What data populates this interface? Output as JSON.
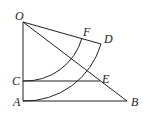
{
  "diagram": {
    "labels": {
      "O": "O",
      "F": "F",
      "D": "D",
      "C": "C",
      "E": "E",
      "A": "A",
      "B": "B"
    },
    "points": {
      "O": [
        23,
        22
      ],
      "F": [
        82,
        38
      ],
      "D": [
        101,
        44
      ],
      "C": [
        23,
        81
      ],
      "E": [
        100,
        81
      ],
      "A": [
        23,
        101
      ],
      "B": [
        127,
        101
      ]
    },
    "segments": [
      "OA",
      "OD",
      "OB",
      "CE",
      "AB"
    ],
    "arcs": [
      "C to F centered at O",
      "A to D centered at O"
    ],
    "stroke_color": "#222222"
  }
}
